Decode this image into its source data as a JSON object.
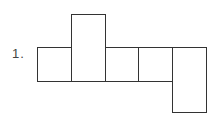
{
  "problem": {
    "number_label": "1."
  },
  "net": {
    "description": "Cube net: row of 5 cells with one cell extending up above the 2nd cell and one extending down below the 5th cell",
    "cells": [
      {
        "id": "row-1",
        "x": 37,
        "y": 47,
        "w": 34,
        "h": 34
      },
      {
        "id": "top-2",
        "x": 71,
        "y": 14,
        "w": 34,
        "h": 67
      },
      {
        "id": "row-3",
        "x": 105,
        "y": 47,
        "w": 34,
        "h": 34
      },
      {
        "id": "row-4",
        "x": 138,
        "y": 47,
        "w": 35,
        "h": 34
      },
      {
        "id": "bottom-5",
        "x": 172,
        "y": 47,
        "w": 34,
        "h": 66
      }
    ],
    "stroke_color": "#333333"
  }
}
